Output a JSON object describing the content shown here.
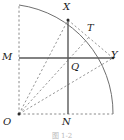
{
  "figure": {
    "kind": "geometry-diagram",
    "width": 124,
    "height": 140,
    "background_color": "#ffffff",
    "stroke_color": "#6f6f6f",
    "solid_stroke_color": "#5a5a5a",
    "label_color": "#1b1b1b",
    "caption": "图 1-2",
    "caption_color": "#b9b9b9",
    "points": [
      {
        "id": "O",
        "label": "O",
        "x": 19,
        "y": 114,
        "label_x": 3,
        "label_y": 116,
        "marked": true
      },
      {
        "id": "M",
        "label": "M",
        "x": 19,
        "y": 58,
        "label_x": 2,
        "label_y": 51,
        "marked": false
      },
      {
        "id": "X",
        "label": "X",
        "x": 68,
        "y": 20,
        "label_x": 63,
        "label_y": 2,
        "marked": true
      },
      {
        "id": "T",
        "label": "T",
        "x": 88,
        "y": 38,
        "label_x": 88,
        "label_y": 23,
        "marked": false
      },
      {
        "id": "Y",
        "label": "Y",
        "x": 113,
        "y": 58,
        "label_x": 112,
        "label_y": 50,
        "marked": true
      },
      {
        "id": "Q",
        "label": "Q",
        "x": 74,
        "y": 64,
        "label_x": 72,
        "label_y": 62,
        "marked": false
      },
      {
        "id": "N",
        "label": "N",
        "x": 68,
        "y": 114,
        "label_x": 63,
        "label_y": 116,
        "marked": false
      }
    ],
    "segments": [
      {
        "id": "arc-XY-top",
        "name": "arc-quarter-circle",
        "kind": "arc",
        "style": "solid",
        "from": "top-left",
        "to": "bottom-right"
      },
      {
        "id": "seg-MY",
        "name": "segment-M-Y",
        "kind": "line",
        "style": "solid",
        "from": "M",
        "to": "Y"
      },
      {
        "id": "seg-XN",
        "name": "segment-X-N",
        "kind": "line",
        "style": "solid",
        "from": "X",
        "to": "N"
      },
      {
        "id": "seg-OX",
        "name": "segment-O-X",
        "kind": "line",
        "style": "dashed",
        "from": "O",
        "to": "X"
      },
      {
        "id": "seg-OT",
        "name": "segment-O-T",
        "kind": "line",
        "style": "dashed",
        "from": "O",
        "to": "T"
      },
      {
        "id": "seg-OY",
        "name": "segment-O-Y",
        "kind": "line",
        "style": "dashed",
        "from": "O",
        "to": "Y"
      },
      {
        "id": "seg-XY",
        "name": "segment-X-Y",
        "kind": "line",
        "style": "dashed",
        "from": "X",
        "to": "Y"
      },
      {
        "id": "seg-OM",
        "name": "segment-O-M-vertical",
        "kind": "line",
        "style": "dashed",
        "from": "O",
        "to": "top-left"
      },
      {
        "id": "seg-ON",
        "name": "segment-O-N-bottom",
        "kind": "line",
        "style": "dashed",
        "from": "O",
        "to": "bottom-right"
      }
    ],
    "geometry": {
      "center_x": 19,
      "center_y": 114,
      "radius": 109,
      "arc_start_x": 19,
      "arc_start_y": 5,
      "arc_end_x": 113,
      "arc_end_y": 114
    }
  }
}
